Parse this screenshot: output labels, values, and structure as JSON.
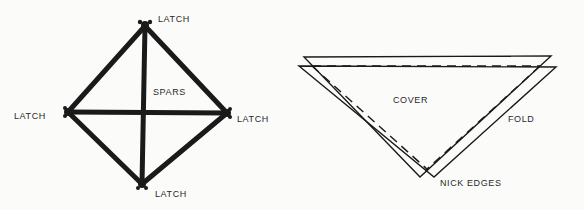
{
  "figure": {
    "left_diagram": {
      "name": "spar-frame",
      "labels": {
        "top": "LATCH",
        "left": "LATCH",
        "right": "LATCH",
        "bottom": "LATCH",
        "center": "SPARS"
      }
    },
    "right_diagram": {
      "name": "cover-triangle",
      "labels": {
        "center": "COVER",
        "fold": "FOLD",
        "bottom": "NICK EDGES"
      }
    },
    "colors": {
      "ink": "#1a1a1a",
      "paper": "#fbfbfa"
    }
  }
}
